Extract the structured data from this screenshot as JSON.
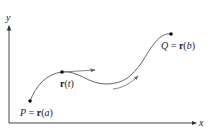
{
  "diagram": {
    "type": "parametric-curve",
    "axes": {
      "x_label": "x",
      "y_label": "y"
    },
    "points": {
      "start": {
        "name": "P",
        "eq": "=",
        "vec": "r",
        "param": "a",
        "label": "P = r(a)"
      },
      "middle": {
        "vec": "r",
        "param": "t",
        "label": "r(t)"
      },
      "end": {
        "name": "Q",
        "eq": "=",
        "vec": "r",
        "param": "b",
        "label": "Q = r(b)"
      }
    },
    "annotations": {
      "tangent_arrow": "tangent vector at r(t)",
      "direction_arrow": "direction of increasing t"
    },
    "colors": {
      "axis": "#333333",
      "curve": "#555555",
      "point": "#111111",
      "text": "#222222",
      "arrow": "#666666"
    }
  }
}
